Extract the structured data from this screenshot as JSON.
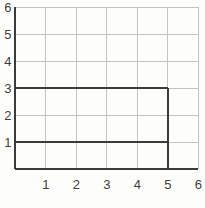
{
  "chart_data": {
    "type": "grid-figure",
    "title": "",
    "xlabel": "",
    "ylabel": "",
    "xlim": [
      0,
      6
    ],
    "ylim": [
      0,
      6
    ],
    "grid": true,
    "x_tick_labels": [
      "1",
      "2",
      "3",
      "4",
      "5",
      "6"
    ],
    "y_tick_labels": [
      "6",
      "5",
      "4",
      "3",
      "2",
      "1"
    ],
    "colors": {
      "grid_line": "#c6c3be",
      "dark_line": "#3b3b3b",
      "background": "#fdfdfc",
      "label_text": "#3d3d3d"
    },
    "figure_segments": [
      {
        "name": "y-axis",
        "x1": 0,
        "y1": 0,
        "x2": 0,
        "y2": 6
      },
      {
        "name": "x-axis",
        "x1": 0,
        "y1": 0,
        "x2": 6,
        "y2": 0
      },
      {
        "name": "rectangle-top",
        "x1": 0,
        "y1": 3,
        "x2": 5,
        "y2": 3
      },
      {
        "name": "rectangle-right",
        "x1": 5,
        "y1": 0,
        "x2": 5,
        "y2": 3
      },
      {
        "name": "inner-line-y1",
        "x1": 0,
        "y1": 1,
        "x2": 5,
        "y2": 1
      }
    ]
  }
}
